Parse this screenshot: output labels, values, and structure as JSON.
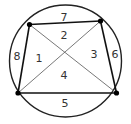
{
  "diagram": {
    "circle": {
      "cx": 65.5,
      "cy": 61,
      "r": 56,
      "stroke": "#222222"
    },
    "vertices": [
      {
        "name": "top-left",
        "x": 29.5,
        "y": 24.5
      },
      {
        "name": "top-right",
        "x": 100.5,
        "y": 21
      },
      {
        "name": "bottom-right",
        "x": 116.5,
        "y": 93
      },
      {
        "name": "bottom-left",
        "x": 18,
        "y": 93
      }
    ],
    "edges": [
      {
        "from": 0,
        "to": 1,
        "weight": "bold"
      },
      {
        "from": 1,
        "to": 2,
        "weight": "bold"
      },
      {
        "from": 2,
        "to": 3,
        "weight": "bold"
      },
      {
        "from": 3,
        "to": 0,
        "weight": "bold"
      }
    ],
    "diagonals": [
      {
        "from": 0,
        "to": 2
      },
      {
        "from": 1,
        "to": 3
      }
    ],
    "labels": [
      {
        "text": "7",
        "x": 64,
        "y": 18
      },
      {
        "text": "2",
        "x": 64,
        "y": 36
      },
      {
        "text": "8",
        "x": 17,
        "y": 57
      },
      {
        "text": "1",
        "x": 39,
        "y": 59
      },
      {
        "text": "3",
        "x": 94,
        "y": 55
      },
      {
        "text": "6",
        "x": 115,
        "y": 55
      },
      {
        "text": "4",
        "x": 64,
        "y": 76
      },
      {
        "text": "5",
        "x": 65,
        "y": 104
      }
    ]
  }
}
